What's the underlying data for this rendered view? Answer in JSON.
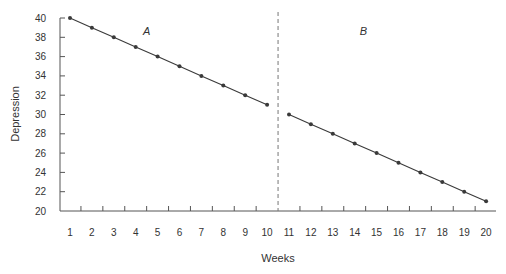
{
  "chart_data": {
    "type": "line",
    "title": "",
    "xlabel": "Weeks",
    "ylabel": "Depression",
    "xlim": [
      1,
      20
    ],
    "ylim": [
      20,
      40
    ],
    "yticks": [
      20,
      22,
      24,
      26,
      28,
      30,
      32,
      34,
      36,
      38,
      40
    ],
    "xticks": [
      1,
      2,
      3,
      4,
      5,
      6,
      7,
      8,
      9,
      10,
      11,
      12,
      13,
      14,
      15,
      16,
      17,
      18,
      19,
      20
    ],
    "grid": false,
    "legend": null,
    "phase_divider": {
      "between": [
        10,
        11
      ],
      "style": "dashed"
    },
    "annotations": [
      {
        "text": "A",
        "x": 4.5,
        "y": 38.2
      },
      {
        "text": "B",
        "x": 14.4,
        "y": 38.2
      }
    ],
    "series": [
      {
        "name": "A",
        "x": [
          1,
          2,
          3,
          4,
          5,
          6,
          7,
          8,
          9,
          10
        ],
        "values": [
          40,
          39,
          38,
          37,
          36,
          35,
          34,
          33,
          32,
          31
        ]
      },
      {
        "name": "B",
        "x": [
          11,
          12,
          13,
          14,
          15,
          16,
          17,
          18,
          19,
          20
        ],
        "values": [
          30,
          29,
          28,
          27,
          26,
          25,
          24,
          23,
          22,
          21
        ]
      }
    ]
  },
  "colors": {
    "line": "#3a3a3a",
    "axis": "#555555",
    "divider": "#777777"
  }
}
